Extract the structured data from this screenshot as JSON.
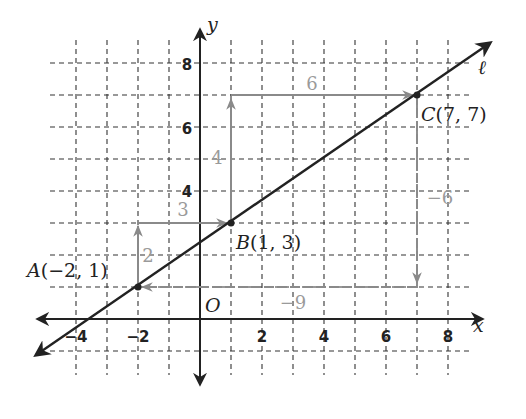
{
  "axes": {
    "x_label": "x",
    "y_label": "y",
    "origin_label": "O",
    "x_ticks": [
      {
        "value": -4,
        "label": "−4"
      },
      {
        "value": -2,
        "label": "−2"
      },
      {
        "value": 2,
        "label": "2"
      },
      {
        "value": 4,
        "label": "4"
      },
      {
        "value": 6,
        "label": "6"
      },
      {
        "value": 8,
        "label": "8"
      }
    ],
    "y_ticks": [
      {
        "value": 4,
        "label": "4"
      },
      {
        "value": 6,
        "label": "6"
      },
      {
        "value": 8,
        "label": "8"
      }
    ]
  },
  "line": {
    "label": "ℓ",
    "slope": "2/3"
  },
  "points": [
    {
      "id": "A",
      "name": "A",
      "coords": "(−2, 1)",
      "x": -2,
      "y": 1
    },
    {
      "id": "B",
      "name": "B",
      "coords": "(1, 3)",
      "x": 1,
      "y": 3
    },
    {
      "id": "C",
      "name": "C",
      "coords": "(7, 7)",
      "x": 7,
      "y": 7
    }
  ],
  "steps": [
    {
      "id": "rise_AB",
      "label": "2",
      "from": "A",
      "direction": "up"
    },
    {
      "id": "run_AB",
      "label": "3",
      "from": "A",
      "direction": "right"
    },
    {
      "id": "rise_BC",
      "label": "4",
      "from": "B",
      "direction": "up"
    },
    {
      "id": "run_BC",
      "label": "6",
      "from": "B",
      "direction": "right"
    },
    {
      "id": "rise_CA",
      "label": "−6",
      "from": "C",
      "direction": "down"
    },
    {
      "id": "run_CA",
      "label": "−9",
      "from": "C",
      "direction": "left"
    }
  ],
  "colors": {
    "ink": "#222222",
    "step_gray": "#8a8a8a",
    "label_gray": "#9a9a9a",
    "grid": "#333333"
  }
}
